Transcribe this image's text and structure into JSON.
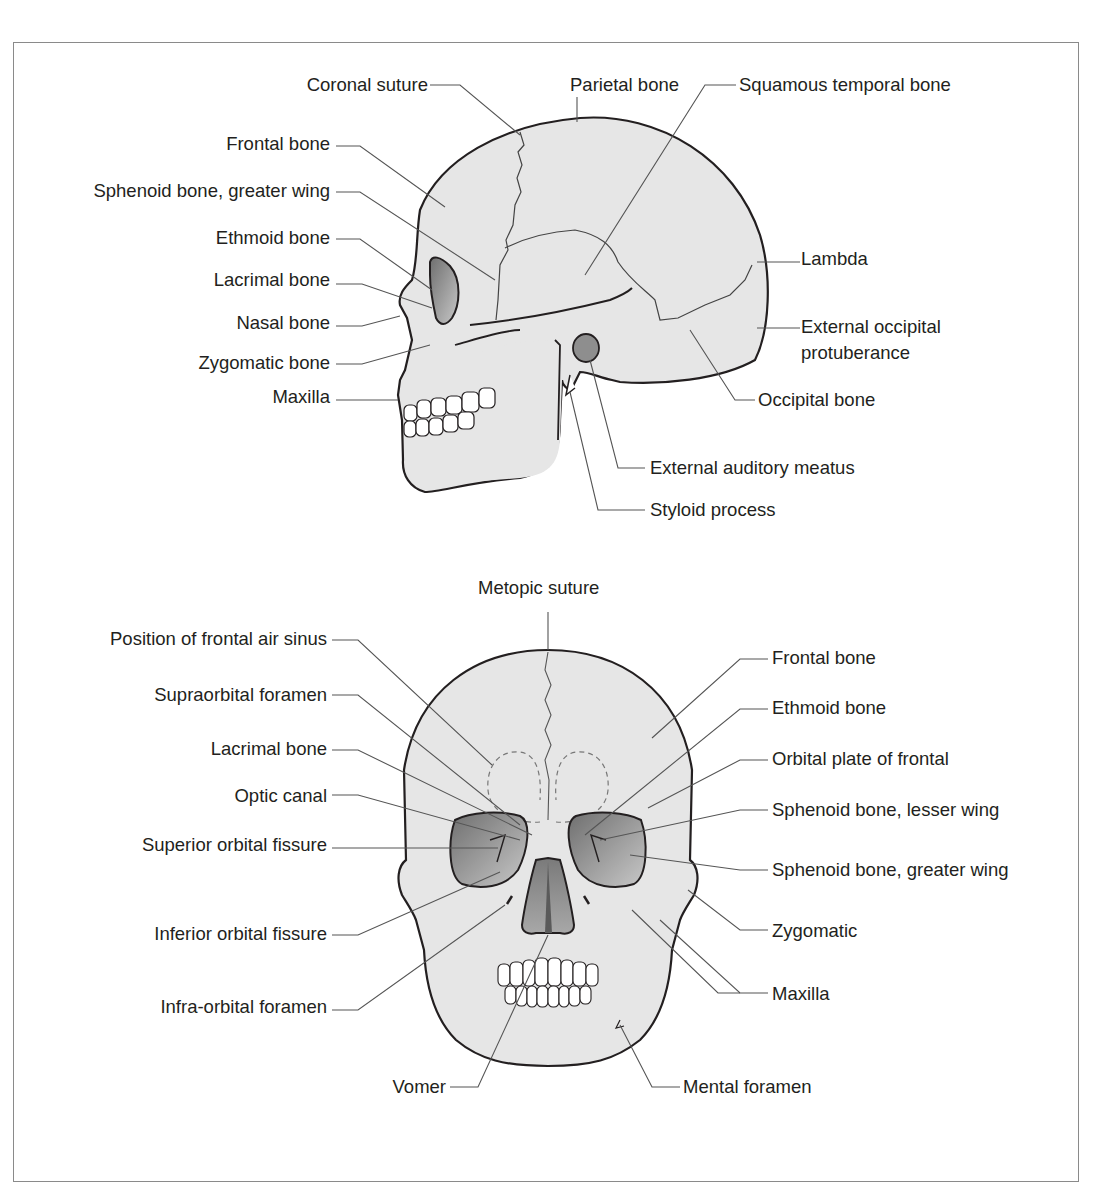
{
  "figure": {
    "lateral_view": {
      "labels": [
        {
          "id": "coronal-suture",
          "text": "Coronal suture"
        },
        {
          "id": "parietal-bone",
          "text": "Parietal bone"
        },
        {
          "id": "squamous-temporal-bone",
          "text": "Squamous temporal bone"
        },
        {
          "id": "frontal-bone",
          "text": "Frontal bone"
        },
        {
          "id": "sphenoid-greater-wing",
          "text": "Sphenoid bone, greater wing"
        },
        {
          "id": "ethmoid-bone",
          "text": "Ethmoid bone"
        },
        {
          "id": "lacrimal-bone",
          "text": "Lacrimal bone"
        },
        {
          "id": "nasal-bone",
          "text": "Nasal bone"
        },
        {
          "id": "zygomatic-bone",
          "text": "Zygomatic bone"
        },
        {
          "id": "maxilla",
          "text": "Maxilla"
        },
        {
          "id": "lambda",
          "text": "Lambda"
        },
        {
          "id": "external-occipital-protuberance-1",
          "text": "External occipital"
        },
        {
          "id": "external-occipital-protuberance-2",
          "text": "protuberance"
        },
        {
          "id": "occipital-bone",
          "text": "Occipital bone"
        },
        {
          "id": "external-auditory-meatus",
          "text": "External auditory meatus"
        },
        {
          "id": "styloid-process",
          "text": "Styloid process"
        }
      ]
    },
    "frontal_view": {
      "labels": [
        {
          "id": "metopic-suture",
          "text": "Metopic suture"
        },
        {
          "id": "frontal-air-sinus",
          "text": "Position of frontal air sinus"
        },
        {
          "id": "supraorbital-foramen",
          "text": "Supraorbital foramen"
        },
        {
          "id": "lacrimal-bone",
          "text": "Lacrimal bone"
        },
        {
          "id": "optic-canal",
          "text": "Optic canal"
        },
        {
          "id": "superior-orbital-fissure",
          "text": "Superior orbital fissure"
        },
        {
          "id": "inferior-orbital-fissure",
          "text": "Inferior orbital fissure"
        },
        {
          "id": "infra-orbital-foramen",
          "text": "Infra-orbital foramen"
        },
        {
          "id": "vomer",
          "text": "Vomer"
        },
        {
          "id": "frontal-bone",
          "text": "Frontal bone"
        },
        {
          "id": "ethmoid-bone",
          "text": "Ethmoid bone"
        },
        {
          "id": "orbital-plate-of-frontal",
          "text": "Orbital plate of frontal"
        },
        {
          "id": "sphenoid-lesser-wing",
          "text": "Sphenoid bone, lesser wing"
        },
        {
          "id": "sphenoid-greater-wing",
          "text": "Sphenoid bone, greater wing"
        },
        {
          "id": "zygomatic",
          "text": "Zygomatic"
        },
        {
          "id": "maxilla",
          "text": "Maxilla"
        },
        {
          "id": "mental-foramen",
          "text": "Mental foramen"
        }
      ]
    },
    "colors": {
      "bone_fill": "#e6e6e6",
      "outline": "#231f20",
      "leader": "#555555",
      "cavity": "#8c8c8c",
      "teeth": "#ffffff"
    }
  }
}
